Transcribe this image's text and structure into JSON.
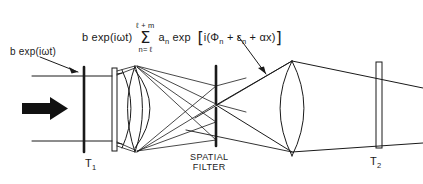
{
  "figure": {
    "background_color": "#ffffff",
    "ink_color": "#1a1a1a"
  },
  "formula": {
    "prefix": "b exp(iωt)",
    "sum_upper_limit": "ℓ + m",
    "sum_symbol": "Σ",
    "sum_lower_limit": "n= ℓ",
    "coefficient": "a",
    "coefficient_sub": "n",
    "exp_label": "exp",
    "bracket_open": "[",
    "bracket_body_1": "i(Φ",
    "bracket_sub_1": "n",
    "plus_1": " + ε",
    "bracket_sub_2": "n",
    "plus_2": " + αx)",
    "bracket_close": "]",
    "full_text": "b exp(iωt) Σ(n=ℓ to ℓ+m) a_n exp [i(Φ_n + ε_n + αx)]"
  },
  "labels": {
    "source": "b exp(iωt)",
    "input_plane": "T",
    "input_plane_sub": "1",
    "output_plane": "T",
    "output_plane_sub": "2",
    "spatial_filter_line1": "SPATIAL",
    "spatial_filter_line2": "FILTER"
  },
  "components": {
    "beam_arrow": "thick-right-arrow",
    "input_plate": "T1 input transparency",
    "first_lens": "biconvex-lens-small",
    "spatial_filter": "slit-aperture-bar",
    "output_lens": "biconvex-lens-large",
    "output_plate": "T2 output plane"
  }
}
